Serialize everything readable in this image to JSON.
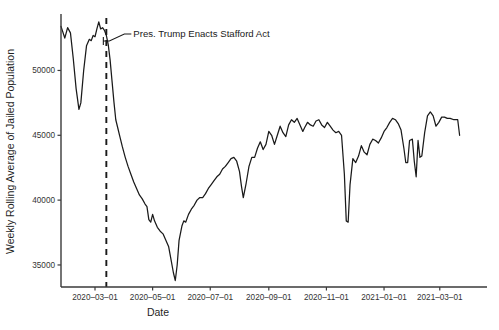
{
  "chart_data": {
    "type": "line",
    "title": "",
    "xlabel": "Date",
    "ylabel": "Weekly Rolling Average of Jailed Population",
    "grid": false,
    "legend": "none",
    "ylim": [
      33300,
      54200
    ],
    "xlim": [
      "2020-01-25",
      "2021-04-20"
    ],
    "yticks": [
      35000,
      40000,
      45000,
      50000
    ],
    "ytick_labels": [
      "35000",
      "40000",
      "45000",
      "50000"
    ],
    "xticks": [
      "2020-03-01",
      "2020-05-01",
      "2020-07-01",
      "2020-09-01",
      "2020-11-01",
      "2021-01-01",
      "2021-03-01"
    ],
    "xtick_labels": [
      "2020–03–01",
      "2020–05–01",
      "2020–07–01",
      "2020–09–01",
      "2020–11–01",
      "2021–01–01",
      "2021–03–01"
    ],
    "annotations": [
      {
        "text": "Pres. Trump Enacts Stafford Act",
        "event_date": "2020-03-13",
        "style": "vertical-dashed-line-with-leader"
      }
    ],
    "series": [
      {
        "name": "Weekly Rolling Average of Jailed Population",
        "color": "#1a1a1a",
        "points": [
          [
            "2020-01-25",
            53400
          ],
          [
            "2020-01-29",
            52500
          ],
          [
            "2020-02-01",
            53300
          ],
          [
            "2020-02-04",
            52900
          ],
          [
            "2020-02-07",
            50900
          ],
          [
            "2020-02-10",
            48600
          ],
          [
            "2020-02-13",
            47000
          ],
          [
            "2020-02-15",
            47500
          ],
          [
            "2020-02-18",
            50000
          ],
          [
            "2020-02-21",
            51900
          ],
          [
            "2020-02-24",
            52400
          ],
          [
            "2020-02-26",
            52300
          ],
          [
            "2020-02-28",
            52700
          ],
          [
            "2020-03-01",
            52600
          ],
          [
            "2020-03-03",
            53200
          ],
          [
            "2020-03-05",
            53750
          ],
          [
            "2020-03-07",
            53200
          ],
          [
            "2020-03-09",
            53300
          ],
          [
            "2020-03-11",
            53100
          ],
          [
            "2020-03-13",
            52700
          ],
          [
            "2020-03-15",
            52000
          ],
          [
            "2020-03-17",
            50800
          ],
          [
            "2020-03-19",
            49200
          ],
          [
            "2020-03-21",
            47600
          ],
          [
            "2020-03-23",
            46200
          ],
          [
            "2020-03-25",
            45600
          ],
          [
            "2020-03-27",
            45000
          ],
          [
            "2020-03-30",
            44100
          ],
          [
            "2020-04-02",
            43300
          ],
          [
            "2020-04-05",
            42600
          ],
          [
            "2020-04-08",
            42000
          ],
          [
            "2020-04-11",
            41400
          ],
          [
            "2020-04-14",
            40900
          ],
          [
            "2020-04-17",
            40400
          ],
          [
            "2020-04-20",
            40100
          ],
          [
            "2020-04-23",
            39700
          ],
          [
            "2020-04-25",
            39500
          ],
          [
            "2020-04-27",
            38500
          ],
          [
            "2020-04-29",
            38300
          ],
          [
            "2020-05-01",
            38900
          ],
          [
            "2020-05-03",
            38400
          ],
          [
            "2020-05-06",
            37900
          ],
          [
            "2020-05-09",
            37600
          ],
          [
            "2020-05-12",
            37400
          ],
          [
            "2020-05-15",
            36900
          ],
          [
            "2020-05-18",
            36400
          ],
          [
            "2020-05-20",
            35600
          ],
          [
            "2020-05-23",
            34400
          ],
          [
            "2020-05-25",
            33800
          ],
          [
            "2020-05-27",
            35000
          ],
          [
            "2020-05-29",
            36900
          ],
          [
            "2020-06-01",
            38000
          ],
          [
            "2020-06-03",
            38400
          ],
          [
            "2020-06-05",
            38300
          ],
          [
            "2020-06-08",
            38900
          ],
          [
            "2020-06-11",
            39300
          ],
          [
            "2020-06-14",
            39600
          ],
          [
            "2020-06-17",
            40000
          ],
          [
            "2020-06-20",
            40200
          ],
          [
            "2020-06-23",
            40200
          ],
          [
            "2020-06-26",
            40500
          ],
          [
            "2020-06-29",
            40900
          ],
          [
            "2020-07-02",
            41200
          ],
          [
            "2020-07-05",
            41500
          ],
          [
            "2020-07-08",
            41800
          ],
          [
            "2020-07-11",
            42000
          ],
          [
            "2020-07-14",
            42400
          ],
          [
            "2020-07-17",
            42600
          ],
          [
            "2020-07-20",
            42900
          ],
          [
            "2020-07-23",
            43200
          ],
          [
            "2020-07-26",
            43300
          ],
          [
            "2020-07-29",
            43000
          ],
          [
            "2020-08-01",
            42200
          ],
          [
            "2020-08-03",
            41100
          ],
          [
            "2020-08-05",
            40200
          ],
          [
            "2020-08-08",
            41300
          ],
          [
            "2020-08-11",
            42600
          ],
          [
            "2020-08-14",
            43300
          ],
          [
            "2020-08-17",
            43300
          ],
          [
            "2020-08-20",
            44000
          ],
          [
            "2020-08-23",
            44500
          ],
          [
            "2020-08-26",
            43900
          ],
          [
            "2020-08-29",
            44300
          ],
          [
            "2020-09-01",
            45300
          ],
          [
            "2020-09-04",
            45000
          ],
          [
            "2020-09-07",
            44300
          ],
          [
            "2020-09-10",
            45000
          ],
          [
            "2020-09-13",
            45700
          ],
          [
            "2020-09-16",
            45200
          ],
          [
            "2020-09-19",
            44900
          ],
          [
            "2020-09-22",
            45800
          ],
          [
            "2020-09-25",
            46200
          ],
          [
            "2020-09-28",
            46000
          ],
          [
            "2020-10-01",
            46300
          ],
          [
            "2020-10-04",
            45800
          ],
          [
            "2020-10-07",
            45300
          ],
          [
            "2020-10-09",
            45600
          ],
          [
            "2020-10-12",
            46000
          ],
          [
            "2020-10-15",
            45800
          ],
          [
            "2020-10-18",
            45700
          ],
          [
            "2020-10-21",
            46100
          ],
          [
            "2020-10-24",
            46200
          ],
          [
            "2020-10-27",
            45800
          ],
          [
            "2020-10-30",
            45600
          ],
          [
            "2020-11-02",
            46000
          ],
          [
            "2020-11-05",
            45700
          ],
          [
            "2020-11-08",
            45400
          ],
          [
            "2020-11-11",
            45200
          ],
          [
            "2020-11-14",
            45300
          ],
          [
            "2020-11-17",
            45000
          ],
          [
            "2020-11-20",
            42000
          ],
          [
            "2020-11-22",
            38400
          ],
          [
            "2020-11-24",
            38300
          ],
          [
            "2020-11-26",
            41200
          ],
          [
            "2020-11-29",
            43200
          ],
          [
            "2020-12-02",
            42900
          ],
          [
            "2020-12-05",
            43400
          ],
          [
            "2020-12-08",
            44200
          ],
          [
            "2020-12-11",
            43700
          ],
          [
            "2020-12-14",
            43500
          ],
          [
            "2020-12-17",
            44300
          ],
          [
            "2020-12-20",
            44700
          ],
          [
            "2020-12-23",
            44600
          ],
          [
            "2020-12-26",
            44400
          ],
          [
            "2020-12-29",
            44800
          ],
          [
            "2021-01-01",
            45300
          ],
          [
            "2021-01-04",
            45600
          ],
          [
            "2021-01-07",
            46000
          ],
          [
            "2021-01-10",
            46300
          ],
          [
            "2021-01-13",
            46200
          ],
          [
            "2021-01-16",
            45900
          ],
          [
            "2021-01-19",
            45400
          ],
          [
            "2021-01-22",
            44000
          ],
          [
            "2021-01-24",
            42900
          ],
          [
            "2021-01-26",
            42900
          ],
          [
            "2021-01-28",
            44600
          ],
          [
            "2021-01-31",
            44700
          ],
          [
            "2021-02-02",
            43000
          ],
          [
            "2021-02-04",
            41800
          ],
          [
            "2021-02-06",
            44600
          ],
          [
            "2021-02-08",
            43300
          ],
          [
            "2021-02-10",
            43400
          ],
          [
            "2021-02-13",
            45200
          ],
          [
            "2021-02-16",
            46500
          ],
          [
            "2021-02-19",
            46800
          ],
          [
            "2021-02-22",
            46500
          ],
          [
            "2021-02-25",
            45700
          ],
          [
            "2021-02-28",
            46000
          ],
          [
            "2021-03-03",
            46400
          ],
          [
            "2021-03-06",
            46400
          ],
          [
            "2021-03-09",
            46300
          ],
          [
            "2021-03-12",
            46300
          ],
          [
            "2021-03-16",
            46200
          ],
          [
            "2021-03-20",
            46200
          ],
          [
            "2021-03-22",
            45000
          ]
        ]
      }
    ]
  },
  "figure": {
    "plot_area": {
      "left": 61,
      "right": 487,
      "top": 16,
      "bottom": 287
    }
  }
}
